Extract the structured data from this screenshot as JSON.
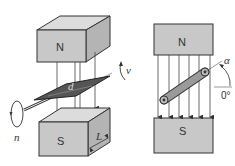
{
  "diagram": {
    "left_view": {
      "top_magnet_label": "N",
      "bottom_magnet_label": "S",
      "plate_label": "d",
      "length_label": "L",
      "rotation_label": "n",
      "velocity_label": "v"
    },
    "right_view": {
      "top_magnet_label": "N",
      "bottom_magnet_label": "S",
      "angle_label": "α",
      "reference_angle_label": "0°"
    },
    "colors": {
      "magnet_front": "#c8c8c8",
      "magnet_top": "#dcdcdc",
      "magnet_side": "#b4b4b4",
      "plate": "#555555",
      "rod": "#9a9a9a",
      "outline": "#333333"
    }
  }
}
